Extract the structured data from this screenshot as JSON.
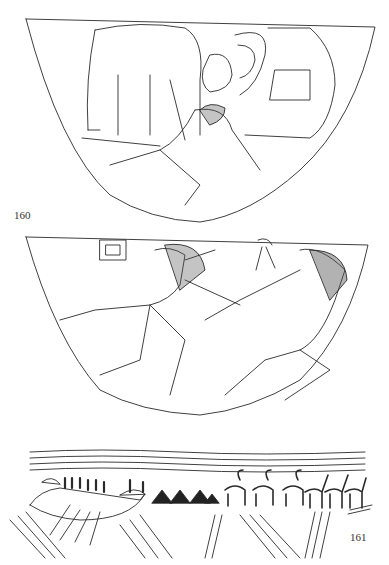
{
  "figures": [
    {
      "id_label": "160",
      "description": "Line drawing of carved bowl: quadruped (cattle) standing over reclining human figure, ram head and crenellated enclosure",
      "panels": [
        "upper-bowl",
        "middle-bowl"
      ]
    },
    {
      "id_label": "161",
      "description": "Frieze: boat with rowers, water lines, triangular hills, horned animals and ostrich-like birds"
    }
  ],
  "colors": {
    "ink": "#2a2a2a",
    "paper": "#ffffff"
  }
}
